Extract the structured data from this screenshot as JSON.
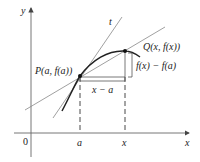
{
  "figure": {
    "type": "secant-tangent-diagram",
    "axes": {
      "x_label": "x",
      "y_label": "y",
      "origin_label": "0"
    },
    "ticks": {
      "a_label": "a",
      "x_label": "x"
    },
    "points": {
      "P": {
        "label": "P(a, f(a))"
      },
      "Q": {
        "label": "Q(x, f(x))"
      }
    },
    "lines": {
      "tangent_label": "t"
    },
    "brackets": {
      "horizontal_label": "x − a",
      "vertical_label": "f(x) − f(a)"
    },
    "colors": {
      "axis": "#555555",
      "curve": "#222222",
      "lines": "#777777",
      "point": "#111111"
    }
  }
}
